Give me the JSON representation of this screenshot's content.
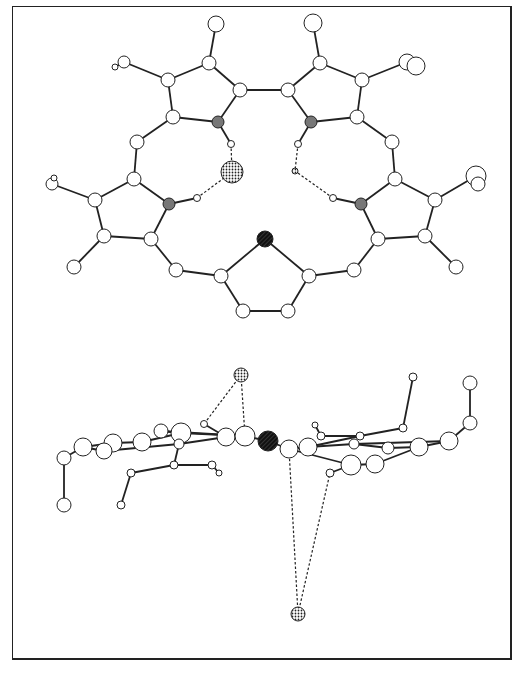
{
  "figure": {
    "colors": {
      "bond": "#222222",
      "atom_fill": "#ffffff",
      "nitrogen": "#777777",
      "heteroatom": "#222222",
      "anion": "#dddddd"
    }
  },
  "top_view": {
    "atoms": [
      {
        "id": "a1",
        "x": 216,
        "y": 24,
        "r": 8
      },
      {
        "id": "a2",
        "x": 313,
        "y": 23,
        "r": 9
      },
      {
        "id": "a3",
        "x": 209,
        "y": 63,
        "r": 7
      },
      {
        "id": "a4",
        "x": 320,
        "y": 63,
        "r": 7
      },
      {
        "id": "a5",
        "x": 124,
        "y": 62,
        "r": 6
      },
      {
        "id": "a5h",
        "x": 115,
        "y": 67,
        "r": 3
      },
      {
        "id": "a6",
        "x": 168,
        "y": 80,
        "r": 7
      },
      {
        "id": "a7",
        "x": 240,
        "y": 90,
        "r": 7
      },
      {
        "id": "a8",
        "x": 288,
        "y": 90,
        "r": 7
      },
      {
        "id": "a9",
        "x": 362,
        "y": 80,
        "r": 7
      },
      {
        "id": "a10",
        "x": 407,
        "y": 62,
        "r": 8
      },
      {
        "id": "a10b",
        "x": 416,
        "y": 66,
        "r": 9
      },
      {
        "id": "a11",
        "x": 173,
        "y": 117,
        "r": 7
      },
      {
        "id": "n1",
        "x": 218,
        "y": 122,
        "r": 6,
        "type": "nitrogen"
      },
      {
        "id": "n2",
        "x": 311,
        "y": 122,
        "r": 6,
        "type": "nitrogen"
      },
      {
        "id": "a12",
        "x": 357,
        "y": 117,
        "r": 7
      },
      {
        "id": "h1",
        "x": 231,
        "y": 144,
        "r": 3.5
      },
      {
        "id": "h2",
        "x": 298,
        "y": 144,
        "r": 3.5
      },
      {
        "id": "a13",
        "x": 137,
        "y": 142,
        "r": 7
      },
      {
        "id": "a14",
        "x": 392,
        "y": 142,
        "r": 7
      },
      {
        "id": "cl1",
        "x": 232,
        "y": 172,
        "r": 11,
        "type": "anion"
      },
      {
        "id": "cl2",
        "x": 295,
        "y": 171,
        "r": 3,
        "type": "anion"
      },
      {
        "id": "a15",
        "x": 52,
        "y": 184,
        "r": 6
      },
      {
        "id": "a15h",
        "x": 54,
        "y": 178,
        "r": 3
      },
      {
        "id": "a16",
        "x": 134,
        "y": 179,
        "r": 7
      },
      {
        "id": "a17",
        "x": 395,
        "y": 179,
        "r": 7
      },
      {
        "id": "a18",
        "x": 476,
        "y": 176,
        "r": 10
      },
      {
        "id": "a18b",
        "x": 478,
        "y": 184,
        "r": 7
      },
      {
        "id": "a19",
        "x": 95,
        "y": 200,
        "r": 7
      },
      {
        "id": "h3",
        "x": 197,
        "y": 198,
        "r": 3.5
      },
      {
        "id": "h4",
        "x": 333,
        "y": 198,
        "r": 3.5
      },
      {
        "id": "a20",
        "x": 435,
        "y": 200,
        "r": 7
      },
      {
        "id": "n3",
        "x": 169,
        "y": 204,
        "r": 6,
        "type": "nitrogen"
      },
      {
        "id": "n4",
        "x": 361,
        "y": 204,
        "r": 6,
        "type": "nitrogen"
      },
      {
        "id": "a21",
        "x": 104,
        "y": 236,
        "r": 7
      },
      {
        "id": "a22",
        "x": 151,
        "y": 239,
        "r": 7
      },
      {
        "id": "a23",
        "x": 378,
        "y": 239,
        "r": 7
      },
      {
        "id": "a24",
        "x": 425,
        "y": 236,
        "r": 7
      },
      {
        "id": "s1",
        "x": 265,
        "y": 239,
        "r": 8,
        "type": "heteroatom"
      },
      {
        "id": "a25",
        "x": 74,
        "y": 267,
        "r": 7
      },
      {
        "id": "a26",
        "x": 456,
        "y": 267,
        "r": 7
      },
      {
        "id": "a27",
        "x": 176,
        "y": 270,
        "r": 7
      },
      {
        "id": "a28",
        "x": 354,
        "y": 270,
        "r": 7
      },
      {
        "id": "a29",
        "x": 221,
        "y": 276,
        "r": 7
      },
      {
        "id": "a30",
        "x": 309,
        "y": 276,
        "r": 7
      },
      {
        "id": "a31",
        "x": 243,
        "y": 311,
        "r": 7
      },
      {
        "id": "a32",
        "x": 288,
        "y": 311,
        "r": 7
      }
    ],
    "bonds": [
      [
        "a1",
        "a3"
      ],
      [
        "a2",
        "a4"
      ],
      [
        "a3",
        "a6"
      ],
      [
        "a3",
        "a7"
      ],
      [
        "a4",
        "a8"
      ],
      [
        "a4",
        "a9"
      ],
      [
        "a5",
        "a6"
      ],
      [
        "a5",
        "a5h"
      ],
      [
        "a7",
        "a8"
      ],
      [
        "a7",
        "n1"
      ],
      [
        "a8",
        "n2"
      ],
      [
        "a6",
        "a11"
      ],
      [
        "a9",
        "a12"
      ],
      [
        "a9",
        "a10"
      ],
      [
        "a11",
        "n1"
      ],
      [
        "a12",
        "n2"
      ],
      [
        "n1",
        "h1"
      ],
      [
        "n2",
        "h2"
      ],
      [
        "a11",
        "a13"
      ],
      [
        "a12",
        "a14"
      ],
      [
        "a13",
        "a16"
      ],
      [
        "a14",
        "a17"
      ],
      [
        "a16",
        "a19"
      ],
      [
        "a16",
        "n3"
      ],
      [
        "a17",
        "a20"
      ],
      [
        "a17",
        "n4"
      ],
      [
        "a15",
        "a19"
      ],
      [
        "a18",
        "a20"
      ],
      [
        "a19",
        "a21"
      ],
      [
        "a20",
        "a24"
      ],
      [
        "a21",
        "a22"
      ],
      [
        "a24",
        "a23"
      ],
      [
        "n3",
        "a22"
      ],
      [
        "n4",
        "a23"
      ],
      [
        "n3",
        "h3"
      ],
      [
        "n4",
        "h4"
      ],
      [
        "a21",
        "a25"
      ],
      [
        "a24",
        "a26"
      ],
      [
        "a22",
        "a27"
      ],
      [
        "a23",
        "a28"
      ],
      [
        "a27",
        "a29"
      ],
      [
        "a28",
        "a30"
      ],
      [
        "s1",
        "a29"
      ],
      [
        "s1",
        "a30"
      ],
      [
        "a29",
        "a31"
      ],
      [
        "a30",
        "a32"
      ],
      [
        "a31",
        "a32"
      ]
    ],
    "hbonds": [
      [
        "h1",
        "cl1"
      ],
      [
        "h3",
        "cl1"
      ],
      [
        "h2",
        "cl2"
      ],
      [
        "h4",
        "cl2"
      ]
    ]
  },
  "side_view": {
    "atoms": [
      {
        "id": "b1",
        "x": 241,
        "y": 375,
        "r": 7,
        "type": "anion"
      },
      {
        "id": "b2",
        "x": 298,
        "y": 614,
        "r": 7,
        "type": "anion"
      },
      {
        "id": "b3",
        "x": 413,
        "y": 377,
        "r": 4
      },
      {
        "id": "b4",
        "x": 470,
        "y": 383,
        "r": 7
      },
      {
        "id": "b5",
        "x": 204,
        "y": 424,
        "r": 3.5
      },
      {
        "id": "b6",
        "x": 403,
        "y": 428,
        "r": 4
      },
      {
        "id": "b7",
        "x": 470,
        "y": 423,
        "r": 7
      },
      {
        "id": "b8",
        "x": 315,
        "y": 425,
        "r": 3
      },
      {
        "id": "b9",
        "x": 161,
        "y": 431,
        "r": 7
      },
      {
        "id": "b10",
        "x": 181,
        "y": 433,
        "r": 10
      },
      {
        "id": "b11",
        "x": 226,
        "y": 437,
        "r": 9
      },
      {
        "id": "b12",
        "x": 245,
        "y": 436,
        "r": 10
      },
      {
        "id": "b13",
        "x": 321,
        "y": 436,
        "r": 4
      },
      {
        "id": "b14",
        "x": 360,
        "y": 436,
        "r": 4
      },
      {
        "id": "b15",
        "x": 113,
        "y": 443,
        "r": 9
      },
      {
        "id": "b16",
        "x": 142,
        "y": 442,
        "r": 9
      },
      {
        "id": "s2",
        "x": 268,
        "y": 441,
        "r": 10,
        "type": "heteroatom"
      },
      {
        "id": "b17",
        "x": 449,
        "y": 441,
        "r": 9
      },
      {
        "id": "b18",
        "x": 83,
        "y": 447,
        "r": 9
      },
      {
        "id": "b19",
        "x": 104,
        "y": 451,
        "r": 8
      },
      {
        "id": "b20",
        "x": 289,
        "y": 449,
        "r": 9
      },
      {
        "id": "b21",
        "x": 308,
        "y": 447,
        "r": 9
      },
      {
        "id": "b22",
        "x": 354,
        "y": 444,
        "r": 5
      },
      {
        "id": "b23",
        "x": 388,
        "y": 448,
        "r": 6
      },
      {
        "id": "b24",
        "x": 419,
        "y": 447,
        "r": 9
      },
      {
        "id": "b25",
        "x": 179,
        "y": 444,
        "r": 5
      },
      {
        "id": "b26",
        "x": 64,
        "y": 458,
        "r": 7
      },
      {
        "id": "b27",
        "x": 351,
        "y": 465,
        "r": 10
      },
      {
        "id": "b28",
        "x": 375,
        "y": 464,
        "r": 9
      },
      {
        "id": "b29",
        "x": 174,
        "y": 465,
        "r": 4
      },
      {
        "id": "b30",
        "x": 212,
        "y": 465,
        "r": 4
      },
      {
        "id": "b31",
        "x": 219,
        "y": 473,
        "r": 3
      },
      {
        "id": "b32",
        "x": 330,
        "y": 473,
        "r": 4
      },
      {
        "id": "b33",
        "x": 131,
        "y": 473,
        "r": 4
      },
      {
        "id": "b34",
        "x": 64,
        "y": 505,
        "r": 7
      },
      {
        "id": "b35",
        "x": 121,
        "y": 505,
        "r": 4
      }
    ],
    "bonds": [
      [
        "b3",
        "b6"
      ],
      [
        "b4",
        "b7"
      ],
      [
        "b7",
        "b17"
      ],
      [
        "b6",
        "b14"
      ],
      [
        "b14",
        "b13"
      ],
      [
        "b13",
        "b8"
      ],
      [
        "b5",
        "b11"
      ],
      [
        "b9",
        "b12"
      ],
      [
        "b11",
        "b12"
      ],
      [
        "b10",
        "b9"
      ],
      [
        "b16",
        "b10"
      ],
      [
        "b15",
        "b16"
      ],
      [
        "b18",
        "b15"
      ],
      [
        "b18",
        "b19"
      ],
      [
        "b12",
        "s2"
      ],
      [
        "s2",
        "b20"
      ],
      [
        "b20",
        "b21"
      ],
      [
        "b21",
        "b22"
      ],
      [
        "b22",
        "b23"
      ],
      [
        "b23",
        "b24"
      ],
      [
        "b24",
        "b17"
      ],
      [
        "b18",
        "b26"
      ],
      [
        "b26",
        "b34"
      ],
      [
        "b29",
        "b33"
      ],
      [
        "b33",
        "b35"
      ],
      [
        "b29",
        "b30"
      ],
      [
        "b30",
        "b31"
      ],
      [
        "b25",
        "b29"
      ],
      [
        "b25",
        "b11"
      ],
      [
        "b20",
        "b27"
      ],
      [
        "b27",
        "b28"
      ],
      [
        "b28",
        "b24"
      ],
      [
        "b32",
        "b27"
      ],
      [
        "b19",
        "b25"
      ],
      [
        "b21",
        "b14"
      ],
      [
        "b10",
        "b12"
      ],
      [
        "b22",
        "b17"
      ]
    ],
    "hbonds": [
      [
        "b1",
        "b5"
      ],
      [
        "b1",
        "b12"
      ],
      [
        "b2",
        "b20"
      ],
      [
        "b2",
        "b32"
      ]
    ]
  }
}
